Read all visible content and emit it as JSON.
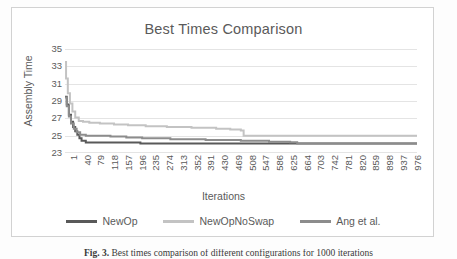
{
  "figure": {
    "caption_prefix": "Fig. 3.",
    "caption_rest": " Best times comparison of different configurations for 1000 iterations"
  },
  "chart": {
    "title": "Best Times Comparison",
    "xlabel": "Iterations",
    "ylabel": "Assembly Time"
  },
  "colors": {
    "series_newop": "#595959",
    "series_newopnoswap": "#c3c3c3",
    "series_ang": "#8c8c8c",
    "gridline": "#e4e4e4",
    "axis_text": "#5a5a5a",
    "frame": "#d2d2d2"
  },
  "chart_data": {
    "type": "line",
    "title": "Best Times Comparison",
    "xlabel": "Iterations",
    "ylabel": "Assembly Time",
    "xlim": [
      1,
      1000
    ],
    "ylim": [
      23,
      35
    ],
    "yticks": [
      23,
      25,
      27,
      29,
      31,
      33,
      35
    ],
    "xticks": [
      1,
      40,
      79,
      118,
      157,
      196,
      235,
      274,
      313,
      352,
      391,
      430,
      469,
      508,
      547,
      586,
      625,
      664,
      703,
      742,
      781,
      820,
      859,
      898,
      937,
      976
    ],
    "grid": true,
    "legend_position": "bottom",
    "series": [
      {
        "name": "NewOp",
        "color": "#595959",
        "x": [
          1,
          6,
          12,
          18,
          24,
          30,
          36,
          42,
          48,
          60,
          80,
          120,
          170,
          215,
          1000
        ],
        "y": [
          29.5,
          28.6,
          27.4,
          26.6,
          26.0,
          25.5,
          25.1,
          24.7,
          24.4,
          24.2,
          24.2,
          24.2,
          24.2,
          24.1,
          24.1
        ]
      },
      {
        "name": "NewOpNoSwap",
        "color": "#c3c3c3",
        "x": [
          1,
          4,
          9,
          15,
          22,
          30,
          40,
          52,
          70,
          100,
          140,
          180,
          230,
          290,
          360,
          430,
          470,
          500,
          508,
          600,
          800,
          1000
        ],
        "y": [
          33.5,
          31.6,
          29.9,
          28.7,
          27.8,
          27.1,
          26.7,
          26.6,
          26.5,
          26.4,
          26.3,
          26.2,
          26.1,
          26.0,
          25.9,
          25.8,
          25.7,
          25.6,
          25.0,
          25.0,
          25.0,
          25.0
        ]
      },
      {
        "name": "Ang et al.",
        "color": "#8c8c8c",
        "x": [
          1,
          6,
          12,
          18,
          26,
          34,
          44,
          60,
          90,
          130,
          175,
          220,
          300,
          400,
          500,
          580,
          640,
          660,
          800,
          1000
        ],
        "y": [
          29.4,
          28.4,
          27.2,
          26.4,
          25.8,
          25.4,
          25.1,
          25.0,
          25.0,
          24.9,
          24.8,
          24.7,
          24.6,
          24.5,
          24.4,
          24.3,
          24.25,
          24.1,
          24.1,
          24.1
        ]
      }
    ]
  }
}
